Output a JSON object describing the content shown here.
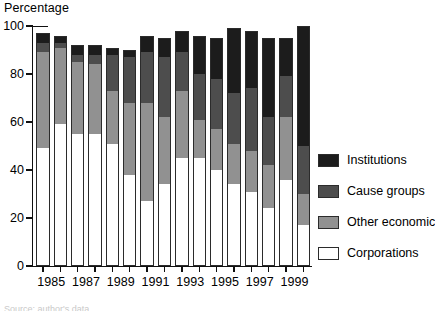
{
  "axis_title": "Percentage",
  "caption_sliver": "Source: author's data",
  "colors": {
    "institutions": "#1c1c1c",
    "cause_groups": "#4d4d4d",
    "other_economic": "#919191",
    "corporations": "#ffffff",
    "axis": "#101010",
    "outline": "#2b2b2b"
  },
  "legend": {
    "items": [
      {
        "label": "Institutions",
        "key": "institutions",
        "color": "#1c1c1c"
      },
      {
        "label": "Cause groups",
        "key": "cause_groups",
        "color": "#4d4d4d"
      },
      {
        "label": "Other economic",
        "key": "other_economic",
        "color": "#919191"
      },
      {
        "label": "Corporations",
        "key": "corporations",
        "color": "#ffffff"
      }
    ]
  },
  "y_axis": {
    "ticks": [
      0,
      20,
      40,
      60,
      80,
      100
    ],
    "tick_labels": [
      "0",
      "20",
      "40",
      "60",
      "80",
      "100"
    ],
    "min": 0,
    "max": 100
  },
  "x_axis": {
    "tick_labels": [
      "1985",
      "1987",
      "1989",
      "1991",
      "1993",
      "1995",
      "1997",
      "1999"
    ],
    "labelled_years": [
      1985,
      1987,
      1989,
      1991,
      1993,
      1995,
      1997,
      1999
    ]
  },
  "chart_data": {
    "type": "bar",
    "subtype": "stacked-vertical",
    "title": "",
    "xlabel": "",
    "ylabel": "Percentage",
    "ylim": [
      0,
      100
    ],
    "grid": false,
    "legend_position": "right",
    "stack_order_bottom_to_top": [
      "Corporations",
      "Other economic",
      "Cause groups",
      "Institutions"
    ],
    "categories": [
      "1985",
      "1986",
      "1987",
      "1988",
      "1989",
      "1990",
      "1991",
      "1992",
      "1993",
      "1994",
      "1995",
      "1996",
      "1997",
      "1998",
      "1999",
      "2000"
    ],
    "series": [
      {
        "name": "Corporations",
        "color": "#ffffff",
        "values": [
          49,
          59,
          55,
          55,
          51,
          38,
          27,
          34,
          45,
          45,
          40,
          34,
          31,
          24,
          36,
          17
        ]
      },
      {
        "name": "Other economic",
        "color": "#919191",
        "values": [
          40,
          32,
          30,
          29,
          22,
          30,
          41,
          28,
          28,
          16,
          17,
          17,
          17,
          18,
          26,
          13
        ]
      },
      {
        "name": "Cause groups",
        "color": "#4d4d4d",
        "values": [
          4,
          2,
          3,
          4,
          15,
          19,
          21,
          25,
          16,
          19,
          21,
          21,
          26,
          20,
          17,
          20
        ]
      },
      {
        "name": "Institutions",
        "color": "#1c1c1c",
        "values": [
          4,
          3,
          4,
          4,
          3,
          3,
          7,
          8,
          9,
          16,
          17,
          27,
          24,
          33,
          16,
          50
        ]
      }
    ],
    "cumulative_tops": [
      {
        "year": "1985",
        "corporations": 49,
        "other_economic": 89,
        "cause_groups": 93,
        "institutions": 97
      },
      {
        "year": "1986",
        "corporations": 59,
        "other_economic": 91,
        "cause_groups": 93,
        "institutions": 96
      },
      {
        "year": "1987",
        "corporations": 55,
        "other_economic": 85,
        "cause_groups": 88,
        "institutions": 92
      },
      {
        "year": "1988",
        "corporations": 55,
        "other_economic": 84,
        "cause_groups": 88,
        "institutions": 92
      },
      {
        "year": "1989",
        "corporations": 51,
        "other_economic": 73,
        "cause_groups": 88,
        "institutions": 91
      },
      {
        "year": "1990",
        "corporations": 38,
        "other_economic": 68,
        "cause_groups": 87,
        "institutions": 90
      },
      {
        "year": "1991",
        "corporations": 27,
        "other_economic": 68,
        "cause_groups": 89,
        "institutions": 96
      },
      {
        "year": "1992",
        "corporations": 34,
        "other_economic": 62,
        "cause_groups": 87,
        "institutions": 95
      },
      {
        "year": "1993",
        "corporations": 45,
        "other_economic": 73,
        "cause_groups": 89,
        "institutions": 98
      },
      {
        "year": "1994",
        "corporations": 45,
        "other_economic": 61,
        "cause_groups": 80,
        "institutions": 96
      },
      {
        "year": "1995",
        "corporations": 40,
        "other_economic": 57,
        "cause_groups": 78,
        "institutions": 95
      },
      {
        "year": "1996",
        "corporations": 34,
        "other_economic": 51,
        "cause_groups": 72,
        "institutions": 99
      },
      {
        "year": "1997",
        "corporations": 31,
        "other_economic": 48,
        "cause_groups": 74,
        "institutions": 98
      },
      {
        "year": "1998",
        "corporations": 24,
        "other_economic": 42,
        "cause_groups": 62,
        "institutions": 95
      },
      {
        "year": "1999",
        "corporations": 36,
        "other_economic": 62,
        "cause_groups": 79,
        "institutions": 95
      },
      {
        "year": "2000",
        "corporations": 17,
        "other_economic": 30,
        "cause_groups": 50,
        "institutions": 100
      }
    ]
  }
}
